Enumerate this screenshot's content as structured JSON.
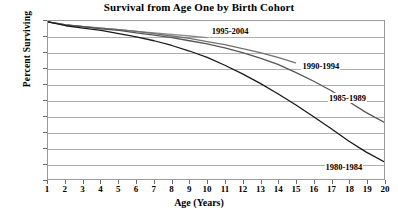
{
  "chart_data": {
    "type": "line",
    "title": "Survival from Age One by Birth Cohort",
    "xlabel": "Age (Years)",
    "ylabel": "Percent Surviving",
    "xlim": [
      1,
      20
    ],
    "ylim": [
      80,
      100
    ],
    "grid": true,
    "legend_position": "inline-annotations",
    "x": [
      1,
      2,
      3,
      4,
      5,
      6,
      7,
      8,
      9,
      10,
      11,
      12,
      13,
      14,
      15,
      16,
      17,
      18,
      19,
      20
    ],
    "xticks": [
      "1",
      "2",
      "3",
      "4",
      "5",
      "6",
      "7",
      "8",
      "9",
      "10",
      "11",
      "12",
      "13",
      "14",
      "15",
      "16",
      "17",
      "18",
      "19",
      "20"
    ],
    "yticks": [
      "80",
      "82",
      "84",
      "86",
      "88",
      "90",
      "92",
      "94",
      "96",
      "98",
      "100"
    ],
    "series": [
      {
        "name": "1995-2004",
        "color": "#8c8c8c",
        "label_x": 10.2,
        "label_y": 98.6,
        "values": [
          99.9,
          99.5,
          99.3,
          99.1,
          98.9,
          98.7,
          98.5,
          98.3,
          98.1,
          97.9,
          null,
          null,
          null,
          null,
          null,
          null,
          null,
          null,
          null,
          null
        ]
      },
      {
        "name": "1990-1994",
        "color": "#707070",
        "label_x": 15.3,
        "label_y": 94.3,
        "values": [
          99.9,
          99.5,
          99.3,
          99.1,
          98.9,
          98.7,
          98.4,
          98.1,
          97.8,
          97.4,
          97.0,
          96.5,
          96.0,
          95.4,
          94.7,
          null,
          null,
          null,
          null,
          null
        ]
      },
      {
        "name": "1985-1989",
        "color": "#555555",
        "label_x": 16.8,
        "label_y": 90.2,
        "values": [
          99.9,
          99.5,
          99.3,
          99.0,
          98.8,
          98.5,
          98.2,
          97.9,
          97.5,
          97.1,
          96.6,
          96.0,
          95.3,
          94.5,
          93.5,
          92.4,
          91.2,
          89.8,
          88.4,
          87.2
        ]
      },
      {
        "name": "1980-1984",
        "color": "#1a1a1a",
        "label_x": 16.6,
        "label_y": 81.6,
        "values": [
          99.9,
          99.4,
          99.1,
          98.8,
          98.4,
          98.0,
          97.5,
          96.9,
          96.2,
          95.4,
          94.4,
          93.3,
          92.1,
          90.8,
          89.4,
          87.9,
          86.4,
          84.8,
          83.4,
          82.2
        ]
      }
    ]
  }
}
